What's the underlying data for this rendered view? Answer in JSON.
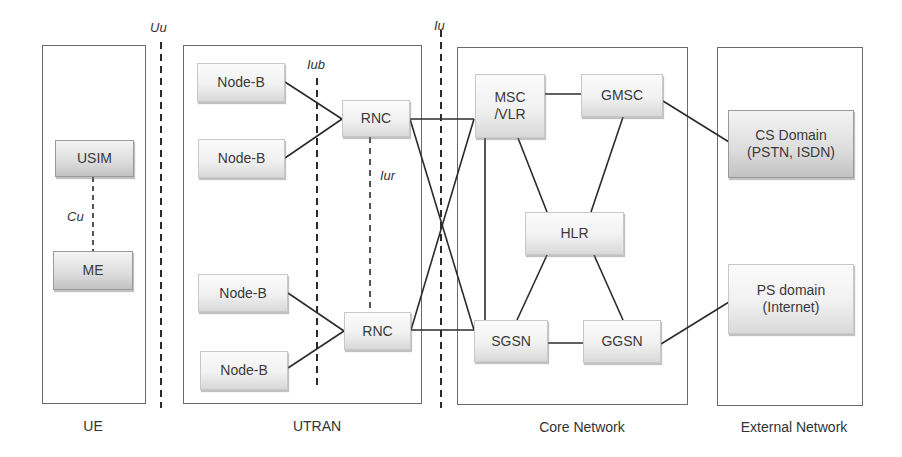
{
  "regions": {
    "ue": {
      "label": "UE"
    },
    "utran": {
      "label": "UTRAN"
    },
    "core": {
      "label": "Core Network"
    },
    "external": {
      "label": "External Network"
    }
  },
  "nodes": {
    "usim": "USIM",
    "me": "ME",
    "node_b_1": "Node-B",
    "node_b_2": "Node-B",
    "node_b_3": "Node-B",
    "node_b_4": "Node-B",
    "rnc_1": "RNC",
    "rnc_2": "RNC",
    "msc_vlr": "MSC\n/VLR",
    "gmsc": "GMSC",
    "hlr": "HLR",
    "sgsn": "SGSN",
    "ggsn": "GGSN",
    "cs_domain": "CS Domain\n(PSTN, ISDN)",
    "ps_domain": "PS domain\n(Internet)"
  },
  "interfaces": {
    "uu": "Uu",
    "cu": "Cu",
    "iub": "Iub",
    "iur": "Iur",
    "iu": "Iu"
  },
  "colors": {
    "line": "#2b2b2b",
    "region_border": "#6b6b6b",
    "node_border": "#c8c8c8"
  }
}
